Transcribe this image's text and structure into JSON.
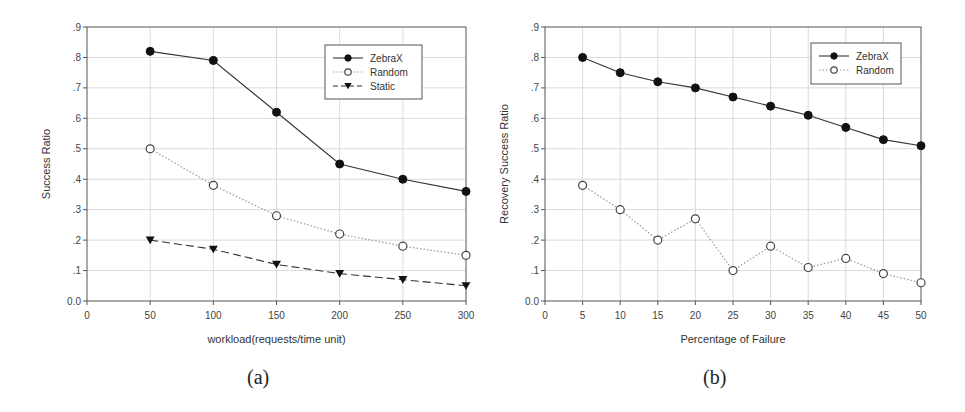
{
  "chart_data": [
    {
      "id": "a",
      "type": "line",
      "caption": "(a)",
      "title": "",
      "xlabel": "workload(requests/time unit)",
      "ylabel": "Success Ratio",
      "xlim": [
        0,
        300
      ],
      "ylim": [
        0,
        0.9
      ],
      "xticks": [
        0,
        50,
        100,
        150,
        200,
        250,
        300
      ],
      "xtick_labels": [
        "0",
        "50",
        "100",
        "150",
        "200",
        "250",
        "300"
      ],
      "yticks": [
        0,
        0.1,
        0.2,
        0.3,
        0.4,
        0.5,
        0.6,
        0.7,
        0.8,
        0.9
      ],
      "ytick_labels": [
        "0.0",
        ".1",
        ".2",
        ".3",
        ".4",
        ".5",
        ".6",
        ".7",
        ".8",
        ".9"
      ],
      "grid": true,
      "legend_position": "upper right",
      "x": [
        50,
        100,
        150,
        200,
        250,
        300
      ],
      "series": [
        {
          "name": "ZebraX",
          "marker": "filled-circle",
          "line": "solid",
          "values": [
            0.82,
            0.79,
            0.62,
            0.45,
            0.4,
            0.36
          ]
        },
        {
          "name": "Random",
          "marker": "open-circle",
          "line": "dotted",
          "values": [
            0.5,
            0.38,
            0.28,
            0.22,
            0.18,
            0.15
          ]
        },
        {
          "name": "Static",
          "marker": "filled-triangle-down",
          "line": "dashed",
          "values": [
            0.2,
            0.17,
            0.12,
            0.09,
            0.07,
            0.05
          ]
        }
      ]
    },
    {
      "id": "b",
      "type": "line",
      "caption": "(b)",
      "title": "",
      "xlabel": "Percentage of Failure",
      "ylabel": "Recovery Success Ratio",
      "xlim": [
        0,
        50
      ],
      "ylim": [
        0,
        0.9
      ],
      "xticks": [
        0,
        5,
        10,
        15,
        20,
        25,
        30,
        35,
        40,
        45,
        50
      ],
      "xtick_labels": [
        "0",
        "5",
        "10",
        "15",
        "20",
        "25",
        "30",
        "35",
        "40",
        "45",
        "50"
      ],
      "yticks": [
        0,
        0.1,
        0.2,
        0.3,
        0.4,
        0.5,
        0.6,
        0.7,
        0.8,
        0.9
      ],
      "ytick_labels": [
        "0.0",
        ".1",
        ".2",
        ".3",
        ".4",
        ".5",
        ".6",
        ".7",
        ".8",
        ".9"
      ],
      "grid": true,
      "legend_position": "upper right",
      "x": [
        5,
        10,
        15,
        20,
        25,
        30,
        35,
        40,
        45,
        50
      ],
      "series": [
        {
          "name": "ZebraX",
          "marker": "filled-circle",
          "line": "solid",
          "values": [
            0.8,
            0.75,
            0.72,
            0.7,
            0.67,
            0.64,
            0.61,
            0.57,
            0.53,
            0.51
          ]
        },
        {
          "name": "Random",
          "marker": "open-circle",
          "line": "dotted",
          "values": [
            0.38,
            0.3,
            0.2,
            0.27,
            0.1,
            0.18,
            0.11,
            0.14,
            0.09,
            0.06
          ]
        }
      ]
    }
  ],
  "colors": {
    "line": "#333333",
    "dotted_line": "#999999",
    "grid": "#d0d0d0",
    "axis": "#555555",
    "marker_fill": "#111111"
  }
}
